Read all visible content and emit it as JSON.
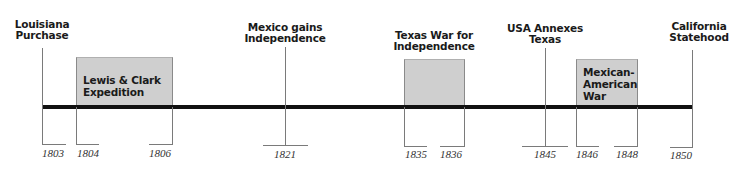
{
  "timeline": {
    "axis": {
      "start_year": "1803",
      "end_year": "1850",
      "color": "#111111"
    },
    "point_events": [
      {
        "label": "Louisiana\nPurchase",
        "year": "1803"
      },
      {
        "label": "Mexico gains\nIndependence",
        "year": "1821"
      },
      {
        "label": "USA Annexes\nTexas",
        "year": "1845"
      },
      {
        "label": "California\nStatehood",
        "year": "1850"
      }
    ],
    "span_events": [
      {
        "label": "Lewis & Clark\nExpedition",
        "start_year": "1804",
        "end_year": "1806",
        "fill": "#cfcfcf"
      },
      {
        "label": "Texas War for\nIndependence",
        "start_year": "1835",
        "end_year": "1836",
        "fill": "#cfcfcf"
      },
      {
        "label": "Mexican-\nAmerican\nWar",
        "start_year": "1846",
        "end_year": "1848",
        "fill": "#cfcfcf"
      }
    ]
  }
}
